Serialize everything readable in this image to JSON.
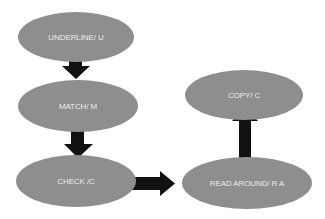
{
  "diagram": {
    "type": "flowchart",
    "node_color": "#8e8e8e",
    "text_color": "#ececec",
    "arrow_color": "#111111",
    "nodes": [
      {
        "id": "underline",
        "label": "UNDERLINE/ U"
      },
      {
        "id": "match",
        "label": "MATCH/ M"
      },
      {
        "id": "check",
        "label": "CHECK /C"
      },
      {
        "id": "read_around",
        "label": "READ AROUND/ R A"
      },
      {
        "id": "copy",
        "label": "COPY/ C"
      }
    ],
    "edges": [
      {
        "from": "underline",
        "to": "match",
        "direction": "down"
      },
      {
        "from": "match",
        "to": "check",
        "direction": "down"
      },
      {
        "from": "check",
        "to": "read_around",
        "direction": "right"
      },
      {
        "from": "read_around",
        "to": "copy",
        "direction": "up"
      }
    ]
  }
}
